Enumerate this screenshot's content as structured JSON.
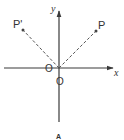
{
  "diagram": {
    "type": "coordinate-plane-reflection",
    "axes": {
      "x_label": "x",
      "y_label": "y",
      "origin_label": "O",
      "origin_label_below": "O"
    },
    "points": [
      {
        "name": "P",
        "label": "P"
      },
      {
        "name": "P-prime",
        "label": "P'"
      }
    ],
    "caption": "A",
    "colors": {
      "axis": "#3a3a3a",
      "dashed": "#555555",
      "point": "#444444",
      "text": "#333333"
    }
  }
}
